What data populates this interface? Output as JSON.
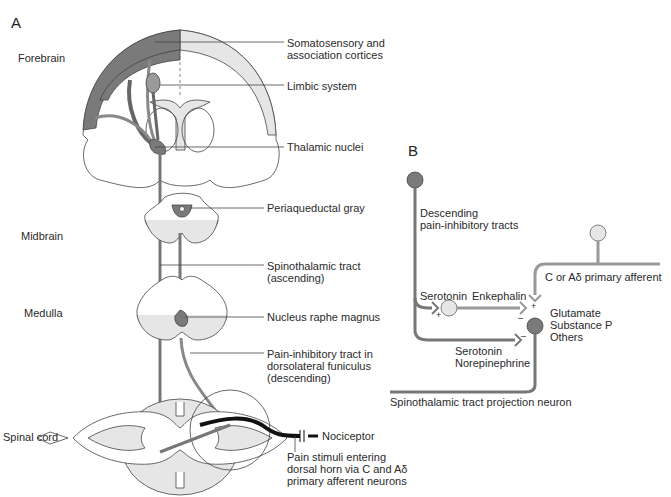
{
  "figure": {
    "panel_a": {
      "letter": "A",
      "regions": {
        "forebrain": "Forebrain",
        "midbrain": "Midbrain",
        "medulla": "Medulla",
        "spinal_cord": "Spinal cord"
      },
      "callouts": {
        "cortices": "Somatosensory and\nassociation cortices",
        "limbic": "Limbic system",
        "thalamic": "Thalamic nuclei",
        "pag": "Periaqueductal gray",
        "spinothalamic": "Spinothalamic tract\n(ascending)",
        "raphe": "Nucleus raphe magnus",
        "pain_inhibitory": "Pain-inhibitory tract in\ndorsolateral funiculus\n(descending)",
        "nociceptor": "Nociceptor",
        "pain_stimuli": "Pain stimuli entering\ndorsal horn via C and Aδ\nprimary afferent neurons"
      }
    },
    "panel_b": {
      "letter": "B",
      "labels": {
        "descending": "Descending\npain-inhibitory tracts",
        "primary_afferent": "C or Aδ primary afferent",
        "serotonin_top": "Serotonin",
        "enkephalin": "Enkephalin",
        "transmitters": "Glutamate\nSubstance P\nOthers",
        "serotonin_ne": "Serotonin\nNorepinephrine",
        "projection_neuron": "Spinothalamic tract projection neuron"
      },
      "signs": {
        "plus": "+",
        "minus": "–"
      }
    },
    "colors": {
      "dark_gray": "#7a7a7a",
      "mid_gray": "#9a9a9a",
      "light_gray": "#e6e6e6",
      "outline": "#444444",
      "black": "#111111"
    }
  }
}
